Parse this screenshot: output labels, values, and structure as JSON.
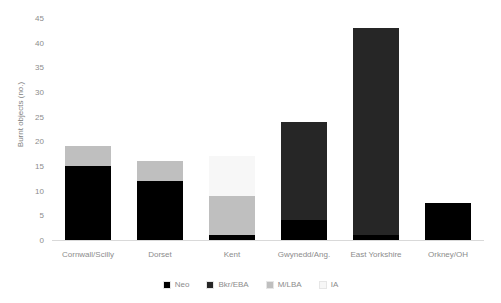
{
  "chart_data": {
    "type": "bar",
    "subtype": "stacked",
    "title": "",
    "xlabel": "",
    "ylabel": "Burnt objects (no.)",
    "ylim": [
      0,
      45
    ],
    "ytick_step": 5,
    "yticks": [
      "45",
      "40",
      "35",
      "30",
      "25",
      "20",
      "15",
      "10",
      "5",
      "0"
    ],
    "grid": false,
    "legend_position": "bottom",
    "categories": [
      "Cornwall/Scilly",
      "Dorset",
      "Kent",
      "Gwynedd/Ang.",
      "East Yorkshire",
      "Orkney/OH"
    ],
    "series": [
      {
        "name": "Neo",
        "color": "#000000",
        "values": [
          15,
          12,
          1,
          4,
          1,
          7.5
        ]
      },
      {
        "name": "Bkr/EBA",
        "color": "#262626",
        "values": [
          0,
          0,
          0,
          20,
          42,
          0
        ]
      },
      {
        "name": "M/LBA",
        "color": "#bfbfbf",
        "values": [
          4,
          4,
          8,
          0,
          0,
          0
        ]
      },
      {
        "name": "IA",
        "color": "#f7f7f7",
        "values": [
          0,
          0,
          8,
          0,
          0,
          0
        ]
      }
    ],
    "totals": [
      19,
      16,
      17,
      24,
      43,
      7.5
    ],
    "axis_color": "#d9d9d9",
    "text_color": "#8c8c8c"
  }
}
